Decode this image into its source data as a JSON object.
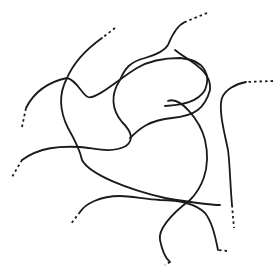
{
  "diagram": {
    "title": "",
    "stroke_color": "#1a1a1a",
    "background_color": "#ffffff",
    "chain_count": 7
  }
}
